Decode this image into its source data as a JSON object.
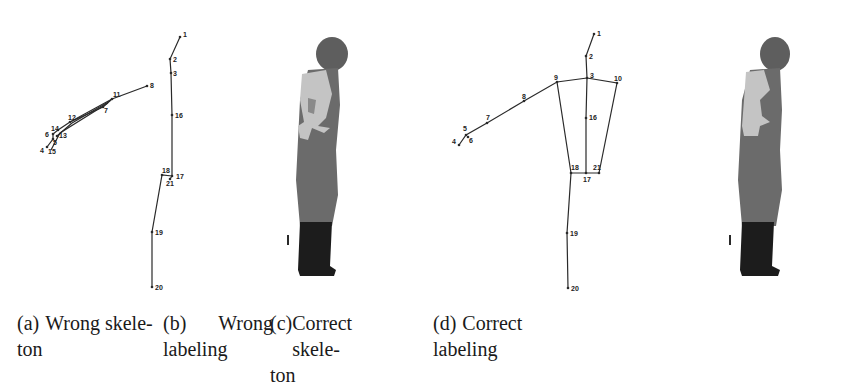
{
  "figure": {
    "panels": [
      {
        "id": "a",
        "type": "skeleton",
        "caption_tag": "(a)",
        "caption_line1": "Wrong skele-",
        "caption_line2": "ton",
        "joints": [
          {
            "n": "1",
            "x": 180,
            "y": 37
          },
          {
            "n": "2",
            "x": 170,
            "y": 59
          },
          {
            "n": "3",
            "x": 171,
            "y": 73
          },
          {
            "n": "8",
            "x": 147,
            "y": 86
          },
          {
            "n": "11",
            "x": 112,
            "y": 99
          },
          {
            "n": "7",
            "x": 103,
            "y": 107
          },
          {
            "n": "12",
            "x": 70,
            "y": 122
          },
          {
            "n": "14",
            "x": 58,
            "y": 130
          },
          {
            "n": "6",
            "x": 53,
            "y": 134
          },
          {
            "n": "13",
            "x": 57,
            "y": 136
          },
          {
            "n": "5",
            "x": 53,
            "y": 139
          },
          {
            "n": "4",
            "x": 47,
            "y": 147
          },
          {
            "n": "15",
            "x": 51,
            "y": 150
          },
          {
            "n": "16",
            "x": 172,
            "y": 115
          },
          {
            "n": "18",
            "x": 162,
            "y": 175
          },
          {
            "n": "17",
            "x": 172,
            "y": 176
          },
          {
            "n": "21",
            "x": 170,
            "y": 179
          },
          {
            "n": "19",
            "x": 152,
            "y": 232
          },
          {
            "n": "20",
            "x": 152,
            "y": 287
          }
        ]
      },
      {
        "id": "b",
        "type": "labeling",
        "caption_tag": "(b)",
        "caption_line1": "Wrong",
        "caption_line2": "labeling"
      },
      {
        "id": "c",
        "type": "skeleton",
        "caption_tag": "(c)",
        "caption_line1": "Correct skele-",
        "caption_line2": "ton",
        "joints": [
          {
            "n": "1",
            "x": 594,
            "y": 34
          },
          {
            "n": "2",
            "x": 586,
            "y": 56
          },
          {
            "n": "3",
            "x": 587,
            "y": 78
          },
          {
            "n": "9",
            "x": 557,
            "y": 82
          },
          {
            "n": "10",
            "x": 617,
            "y": 83
          },
          {
            "n": "8",
            "x": 524,
            "y": 101
          },
          {
            "n": "7",
            "x": 487,
            "y": 123
          },
          {
            "n": "5",
            "x": 466,
            "y": 135
          },
          {
            "n": "6",
            "x": 468,
            "y": 137
          },
          {
            "n": "4",
            "x": 459,
            "y": 145
          },
          {
            "n": "16",
            "x": 586,
            "y": 118
          },
          {
            "n": "18",
            "x": 571,
            "y": 173
          },
          {
            "n": "17",
            "x": 586,
            "y": 173
          },
          {
            "n": "21",
            "x": 599,
            "y": 173
          },
          {
            "n": "19",
            "x": 567,
            "y": 233
          },
          {
            "n": "20",
            "x": 568,
            "y": 288
          }
        ]
      },
      {
        "id": "d",
        "type": "labeling",
        "caption_tag": "(d)",
        "caption_line1": "Correct",
        "caption_line2": "labeling"
      }
    ],
    "colors": {
      "line": "#2a2a2a",
      "head": "#5e5e5e",
      "torso": "#6b6b6b",
      "arm_highlight": "#c4c4c4",
      "legs": "#1c1c1c"
    }
  }
}
